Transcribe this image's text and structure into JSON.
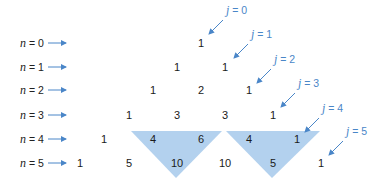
{
  "diagram": {
    "colors": {
      "arrow": "#4a86c8",
      "label_j": "#4a86c8",
      "highlight_triangle": "#b3d1ee",
      "text": "#1a1a1a"
    },
    "row_labels": [
      {
        "var": "n",
        "eq": " = 0",
        "y": 43
      },
      {
        "var": "n",
        "eq": " = 1",
        "y": 67
      },
      {
        "var": "n",
        "eq": " = 2",
        "y": 90
      },
      {
        "var": "n",
        "eq": " = 3",
        "y": 115
      },
      {
        "var": "n",
        "eq": " = 4",
        "y": 139
      },
      {
        "var": "n",
        "eq": " = 5",
        "y": 163
      }
    ],
    "rows": [
      {
        "n": 0,
        "values": [
          "1"
        ],
        "x": [
          201
        ],
        "y": 43
      },
      {
        "n": 1,
        "values": [
          "1",
          "1"
        ],
        "x": [
          177,
          225
        ],
        "y": 67
      },
      {
        "n": 2,
        "values": [
          "1",
          "2",
          "1"
        ],
        "x": [
          153,
          201,
          249
        ],
        "y": 90
      },
      {
        "n": 3,
        "values": [
          "1",
          "3",
          "3",
          "1"
        ],
        "x": [
          129,
          177,
          225,
          273
        ],
        "y": 115
      },
      {
        "n": 4,
        "values": [
          "1",
          "4",
          "6",
          "4",
          "1"
        ],
        "x": [
          104,
          153,
          201,
          249,
          297
        ],
        "y": 139
      },
      {
        "n": 5,
        "values": [
          "1",
          "5",
          "10",
          "10",
          "5",
          "1"
        ],
        "x": [
          80,
          129,
          177,
          225,
          273,
          321
        ],
        "y": 163
      }
    ],
    "diagonal_labels": [
      {
        "var": "j",
        "eq": " = 0",
        "x": 226,
        "y": 10
      },
      {
        "var": "j",
        "eq": " = 1",
        "x": 251,
        "y": 34
      },
      {
        "var": "j",
        "eq": " = 2",
        "x": 274,
        "y": 59
      },
      {
        "var": "j",
        "eq": " = 3",
        "x": 298,
        "y": 83
      },
      {
        "var": "j",
        "eq": " = 4",
        "x": 322,
        "y": 108
      },
      {
        "var": "j",
        "eq": " = 5",
        "x": 346,
        "y": 131
      }
    ],
    "highlights": [
      {
        "name": "triangle-4-6-10",
        "points": "131,131 222,131 176,178"
      },
      {
        "name": "triangle-4-1-5",
        "points": "226,131 320,131 272,178"
      }
    ]
  }
}
